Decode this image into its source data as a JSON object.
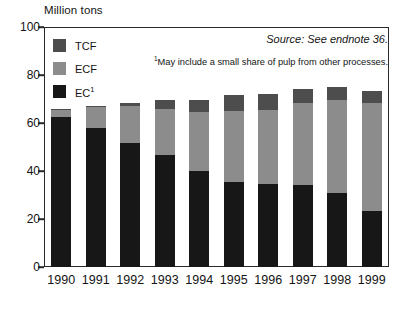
{
  "chart_data": {
    "type": "bar",
    "subtype": "stacked",
    "title": "",
    "xlabel": "",
    "ylabel": "Million tons",
    "ylim": [
      0,
      100
    ],
    "yticks": [
      0,
      20,
      40,
      60,
      80,
      100
    ],
    "grid": false,
    "legend_position": "top-left",
    "categories": [
      "1990",
      "1991",
      "1992",
      "1993",
      "1994",
      "1995",
      "1996",
      "1997",
      "1998",
      "1999"
    ],
    "series": [
      {
        "name": "EC",
        "legend_label": "EC",
        "legend_superscript": "1",
        "color": "#171717",
        "values": [
          62.5,
          58.0,
          51.5,
          46.5,
          40.0,
          35.5,
          34.5,
          34.0,
          31.0,
          23.5
        ]
      },
      {
        "name": "ECF",
        "legend_label": "ECF",
        "color": "#8c8c8c",
        "values": [
          3.0,
          8.5,
          15.5,
          19.5,
          24.5,
          29.5,
          31.0,
          34.5,
          38.5,
          45.0
        ]
      },
      {
        "name": "TCF",
        "legend_label": "TCF",
        "color": "#4d4d4d",
        "values": [
          0.5,
          0.5,
          1.5,
          3.5,
          5.0,
          6.5,
          6.5,
          5.5,
          5.5,
          5.0
        ]
      }
    ],
    "totals": [
      66.0,
      67.0,
      68.5,
      69.5,
      69.5,
      71.5,
      72.0,
      74.0,
      75.0,
      73.5
    ],
    "annotations": {
      "source": "Source: See endnote 36.",
      "footnote_marker": "1",
      "footnote": "May include a small share of pulp from other processes."
    }
  },
  "legend": {
    "items": [
      {
        "label": "TCF",
        "superscript": "",
        "color": "#4d4d4d"
      },
      {
        "label": "ECF",
        "superscript": "",
        "color": "#8c8c8c"
      },
      {
        "label": "EC",
        "superscript": "1",
        "color": "#171717"
      }
    ]
  },
  "axes": {
    "y_title": "Million tons",
    "y_labels": [
      "100",
      "80",
      "60",
      "40",
      "20",
      "0"
    ],
    "x_labels": [
      "1990",
      "1991",
      "1992",
      "1993",
      "1994",
      "1995",
      "1996",
      "1997",
      "1998",
      "1999"
    ]
  },
  "notes": {
    "source": "Source: See endnote 36.",
    "footnote_marker": "1",
    "footnote_text": "May include a small share of pulp from other processes."
  }
}
